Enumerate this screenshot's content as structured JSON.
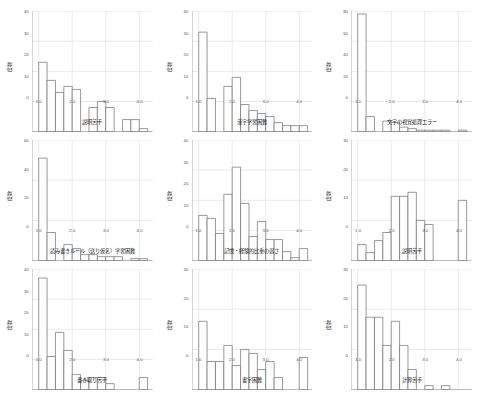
{
  "figure": {
    "rows": 3,
    "columns": 3,
    "background": "#ffffff",
    "bar_fill": "#ffffff",
    "bar_stroke": "#6f6f6f",
    "grid_color": "#d9d9d9",
    "axis_color": "#8a8a8a"
  },
  "common": {
    "ylabel": "度数",
    "xticks": [
      "1.0",
      "2.0",
      "3.0",
      "4.0"
    ],
    "xlim": [
      0.8,
      4.4
    ]
  },
  "chart_data": [
    {
      "type": "bar",
      "title": "",
      "xlabel": "説明苦手",
      "ylabel": "度数",
      "xlim": [
        0.8,
        4.4
      ],
      "ylim": [
        0,
        40
      ],
      "yticks": [
        0,
        10,
        20,
        30,
        40
      ],
      "xticks": [
        1.0,
        2.0,
        3.0,
        4.0
      ],
      "grid": true,
      "bin_width": 0.25,
      "bin_starts": [
        1.0,
        1.25,
        1.5,
        1.75,
        2.0,
        2.25,
        2.5,
        2.75,
        3.0,
        3.25,
        3.5,
        3.75,
        4.0
      ],
      "values": [
        23,
        17,
        13,
        15,
        14,
        0,
        8,
        10,
        8,
        0,
        4,
        4,
        1
      ]
    },
    {
      "type": "bar",
      "title": "",
      "xlabel": "漢字学習困難",
      "ylabel": "度数",
      "xlim": [
        0.8,
        4.4
      ],
      "ylim": [
        0,
        40
      ],
      "yticks": [
        0,
        10,
        20,
        30,
        40
      ],
      "xticks": [
        1.0,
        2.0,
        3.0,
        4.0
      ],
      "grid": true,
      "bin_width": 0.25,
      "bin_starts": [
        1.0,
        1.25,
        1.5,
        1.75,
        2.0,
        2.25,
        2.5,
        2.75,
        3.0,
        3.25,
        3.5,
        3.75,
        4.0
      ],
      "values": [
        33,
        11,
        0,
        15,
        18,
        9,
        7,
        6,
        5,
        3,
        2,
        2,
        2
      ]
    },
    {
      "type": "bar",
      "title": "",
      "xlabel": "文字の視覚処理エラー",
      "ylabel": "度数",
      "xlim": [
        0.8,
        4.4
      ],
      "ylim": [
        0,
        80
      ],
      "yticks": [
        0,
        20,
        40,
        60,
        80
      ],
      "xticks": [
        1.0,
        2.0,
        3.0,
        4.0
      ],
      "grid": true,
      "bin_width": 0.25,
      "bin_starts": [
        1.0,
        1.25,
        1.5,
        1.75,
        2.0,
        2.25,
        2.5,
        2.75,
        3.0,
        3.25,
        3.5,
        3.75,
        4.0
      ],
      "values": [
        78,
        10,
        0,
        7,
        6,
        3,
        2,
        1,
        1,
        1,
        1,
        0,
        1
      ]
    },
    {
      "type": "bar",
      "title": "",
      "xlabel": "読み書きルール（送り仮名）学習困難",
      "ylabel": "度数",
      "xlim": [
        0.8,
        4.4
      ],
      "ylim": [
        0,
        60
      ],
      "yticks": [
        0,
        20,
        40,
        60
      ],
      "xticks": [
        1.0,
        2.0,
        3.0,
        4.0
      ],
      "grid": true,
      "bin_width": 0.25,
      "bin_starts": [
        1.0,
        1.25,
        1.5,
        1.75,
        2.0,
        2.25,
        2.5,
        2.75,
        3.0,
        3.25,
        3.5,
        3.75,
        4.0
      ],
      "values": [
        51,
        14,
        0,
        8,
        6,
        3,
        3,
        2,
        2,
        2,
        0,
        1,
        1
      ]
    },
    {
      "type": "bar",
      "title": "",
      "xlabel": "記憶・経験的比重の弱さ",
      "ylabel": "度数",
      "xlim": [
        0.8,
        4.4
      ],
      "ylim": [
        0,
        40
      ],
      "yticks": [
        0,
        10,
        20,
        30,
        40
      ],
      "xticks": [
        1.0,
        2.0,
        3.0,
        4.0
      ],
      "grid": true,
      "bin_width": 0.25,
      "bin_starts": [
        1.0,
        1.25,
        1.5,
        1.75,
        2.0,
        2.25,
        2.5,
        2.75,
        3.0,
        3.25,
        3.5,
        3.75,
        4.0
      ],
      "values": [
        15,
        14,
        9,
        22,
        31,
        19,
        8,
        13,
        7,
        7,
        3,
        1,
        4
      ]
    },
    {
      "type": "bar",
      "title": "",
      "xlabel": "説明苦手",
      "ylabel": "度数",
      "xlim": [
        0.8,
        4.4
      ],
      "ylim": [
        0,
        30
      ],
      "yticks": [
        0,
        10,
        20,
        30
      ],
      "xticks": [
        1.0,
        2.0,
        3.0,
        4.0
      ],
      "grid": true,
      "bin_width": 0.25,
      "bin_starts": [
        1.0,
        1.25,
        1.5,
        1.75,
        2.0,
        2.25,
        2.5,
        2.75,
        3.0,
        3.25,
        3.5,
        3.75,
        4.0
      ],
      "values": [
        4,
        2,
        5,
        7,
        16,
        16,
        17,
        10,
        9,
        0,
        0,
        0,
        15
      ]
    },
    {
      "type": "bar",
      "title": "",
      "xlabel": "書き取り苦手",
      "ylabel": "度数",
      "xlim": [
        0.8,
        4.4
      ],
      "ylim": [
        0,
        40
      ],
      "yticks": [
        0,
        10,
        20,
        30,
        40
      ],
      "xticks": [
        1.0,
        2.0,
        3.0,
        4.0
      ],
      "grid": true,
      "bin_width": 0.25,
      "bin_starts": [
        1.0,
        1.25,
        1.5,
        1.75,
        2.0,
        2.25,
        2.5,
        2.75,
        3.0,
        3.25,
        3.5,
        3.75,
        4.0
      ],
      "values": [
        37,
        11,
        19,
        13,
        5,
        3,
        4,
        4,
        2,
        0,
        0,
        0,
        4
      ]
    },
    {
      "type": "bar",
      "title": "",
      "xlabel": "書字困難",
      "ylabel": "度数",
      "xlim": [
        0.8,
        4.4
      ],
      "ylim": [
        0,
        30
      ],
      "yticks": [
        0,
        10,
        20,
        30
      ],
      "xticks": [
        1.0,
        2.0,
        3.0,
        4.0
      ],
      "grid": true,
      "bin_width": 0.25,
      "bin_starts": [
        1.0,
        1.25,
        1.5,
        1.75,
        2.0,
        2.25,
        2.5,
        2.75,
        3.0,
        3.25,
        3.5,
        3.75,
        4.0
      ],
      "values": [
        17,
        7,
        7,
        11,
        6,
        10,
        9,
        5,
        7,
        3,
        0,
        0,
        8
      ]
    },
    {
      "type": "bar",
      "title": "",
      "xlabel": "計算苦手",
      "ylabel": "度数",
      "xlim": [
        0.8,
        4.4
      ],
      "ylim": [
        0,
        30
      ],
      "yticks": [
        0,
        10,
        20,
        30
      ],
      "xticks": [
        1.0,
        2.0,
        3.0,
        4.0
      ],
      "grid": true,
      "bin_width": 0.25,
      "bin_starts": [
        1.0,
        1.25,
        1.5,
        1.75,
        2.0,
        2.25,
        2.5,
        2.75,
        3.0,
        3.25,
        3.5,
        3.75,
        4.0
      ],
      "values": [
        26,
        18,
        18,
        11,
        17,
        11,
        5,
        0,
        1,
        0,
        1,
        0,
        0
      ]
    }
  ]
}
